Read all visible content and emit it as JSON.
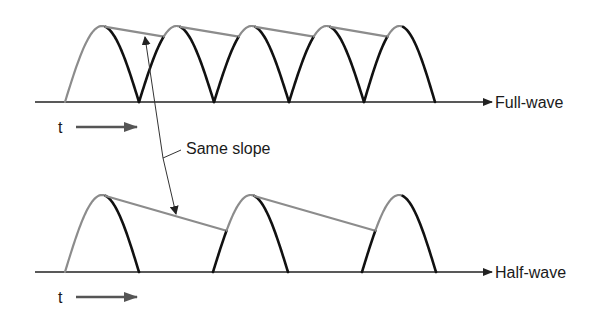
{
  "figure": {
    "labels": {
      "full_wave": "Full-wave",
      "half_wave": "Half-wave",
      "time_top": "t",
      "time_bottom": "t",
      "annotation": "Same slope"
    },
    "colors": {
      "rectified_wave": "#111111",
      "charging_curve": "#8c8c8c",
      "ripple_decay": "#8c8c8c",
      "axis": "#222222",
      "time_arrow": "#555555",
      "leader_line": "#333333"
    },
    "panels": [
      {
        "name": "full-wave",
        "axis_y": 102,
        "axis_x_start": 35,
        "axis_x_end": 490,
        "peak_y": 26,
        "hump_edges": [
          65,
          139,
          214,
          289,
          364,
          435
        ],
        "note": "Capacitor charges on every half-cycle; ripple decays between consecutive humps"
      },
      {
        "name": "half-wave",
        "axis_y": 272,
        "axis_x_start": 35,
        "axis_x_end": 490,
        "peak_y": 195,
        "hump_edges": [
          [
            65,
            139
          ],
          [
            213,
            288
          ],
          [
            362,
            436
          ]
        ],
        "note": "Capacitor charges once per cycle; longer decay gives larger ripple"
      }
    ]
  }
}
